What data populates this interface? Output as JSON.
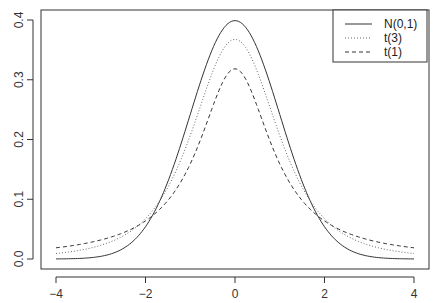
{
  "chart_data": {
    "type": "line",
    "title": "",
    "xlabel": "",
    "ylabel": "",
    "xlim": [
      -4,
      4
    ],
    "ylim": [
      0,
      0.4
    ],
    "x_ticks": [
      -4,
      -2,
      0,
      2,
      4
    ],
    "x_tick_labels": [
      "−4",
      "−2",
      "0",
      "2",
      "4"
    ],
    "y_ticks": [
      0.0,
      0.1,
      0.2,
      0.3,
      0.4
    ],
    "y_tick_labels": [
      "0.0",
      "0.1",
      "0.2",
      "0.3",
      "0.4"
    ],
    "grid": false,
    "legend_position": "top-right",
    "series": [
      {
        "name": "N(0,1)",
        "style": "solid",
        "color": "#333333",
        "x": [
          -4,
          -3,
          -2,
          -1.5,
          -1,
          -0.5,
          0,
          0.5,
          1,
          1.5,
          2,
          3,
          4
        ],
        "values": [
          0.0001,
          0.0044,
          0.054,
          0.1295,
          0.242,
          0.3521,
          0.3989,
          0.3521,
          0.242,
          0.1295,
          0.054,
          0.0044,
          0.0001
        ]
      },
      {
        "name": "t(3)",
        "style": "dotted",
        "color": "#555555",
        "x": [
          -4,
          -3,
          -2,
          -1.5,
          -1,
          -0.5,
          0,
          0.5,
          1,
          1.5,
          2,
          3,
          4
        ],
        "values": [
          0.0092,
          0.0229,
          0.0675,
          0.1274,
          0.2067,
          0.3104,
          0.3676,
          0.3104,
          0.2067,
          0.1274,
          0.0675,
          0.0229,
          0.0092
        ]
      },
      {
        "name": "t(1)",
        "style": "dashed",
        "color": "#333333",
        "x": [
          -4,
          -3,
          -2,
          -1.5,
          -1,
          -0.5,
          0,
          0.5,
          1,
          1.5,
          2,
          3,
          4
        ],
        "values": [
          0.0187,
          0.0318,
          0.0637,
          0.0979,
          0.1592,
          0.2546,
          0.3183,
          0.2546,
          0.1592,
          0.0979,
          0.0637,
          0.0318,
          0.0187
        ]
      }
    ]
  },
  "legend": {
    "entries": [
      {
        "label": "N(0,1)",
        "style": "solid"
      },
      {
        "label": "t(3)",
        "style": "dotted"
      },
      {
        "label": "t(1)",
        "style": "dashed"
      }
    ]
  },
  "colors": {
    "axis": "#333333",
    "line": "#333333"
  }
}
